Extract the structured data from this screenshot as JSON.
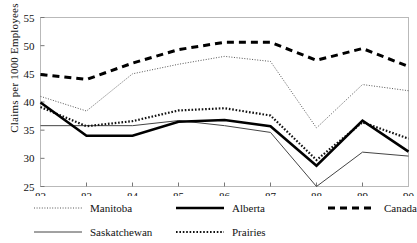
{
  "chart_data": {
    "type": "line",
    "title": "",
    "xlabel": "",
    "ylabel": "Claims per 1000 Employees",
    "x": [
      82,
      83,
      84,
      85,
      86,
      87,
      88,
      89,
      90
    ],
    "xtick_labels": [
      "82",
      "83",
      "84",
      "85",
      "86",
      "87",
      "88",
      "89",
      "90"
    ],
    "ytick_labels": [
      "25",
      "30",
      "35",
      "40",
      "45",
      "50",
      "55"
    ],
    "yticks": [
      25,
      30,
      35,
      40,
      45,
      50,
      55
    ],
    "ylim": [
      25,
      55
    ],
    "xlim": [
      82,
      90
    ],
    "grid": false,
    "legend_position": "below-plot",
    "series": [
      {
        "name": "Manitoba",
        "style": "fine-dotted",
        "color": "#555555",
        "width": 1,
        "values": [
          41.0,
          38.4,
          45.0,
          46.7,
          48.1,
          47.2,
          35.4,
          43.1,
          42.0
        ]
      },
      {
        "name": "Saskatchewan",
        "style": "thin-solid",
        "color": "#444444",
        "width": 1,
        "values": [
          35.8,
          35.8,
          35.8,
          36.7,
          35.8,
          34.6,
          25.0,
          31.1,
          30.4
        ]
      },
      {
        "name": "Alberta",
        "style": "thick-solid",
        "color": "#000000",
        "width": 2.6,
        "values": [
          39.9,
          34.0,
          34.0,
          36.5,
          36.8,
          35.7,
          28.7,
          36.7,
          31.2
        ]
      },
      {
        "name": "Prairies",
        "style": "medium-dotted",
        "color": "#111111",
        "width": 2.2,
        "values": [
          39.1,
          35.7,
          36.6,
          38.5,
          38.9,
          37.6,
          29.7,
          36.4,
          33.5
        ]
      },
      {
        "name": "Canada",
        "style": "thick-dashed",
        "color": "#000000",
        "width": 3,
        "values": [
          44.9,
          44.0,
          46.9,
          49.3,
          50.6,
          50.6,
          47.4,
          49.5,
          46.3
        ]
      }
    ]
  },
  "legend": {
    "items": [
      {
        "label": "Manitoba",
        "style": "fine-dotted"
      },
      {
        "label": "Alberta",
        "style": "thick-solid"
      },
      {
        "label": "Canada",
        "style": "thick-dashed"
      },
      {
        "label": "Saskatchewan",
        "style": "thin-solid"
      },
      {
        "label": "Prairies",
        "style": "medium-dotted"
      }
    ]
  },
  "axis": {
    "y_title": "Claims per 1000 Employees"
  }
}
